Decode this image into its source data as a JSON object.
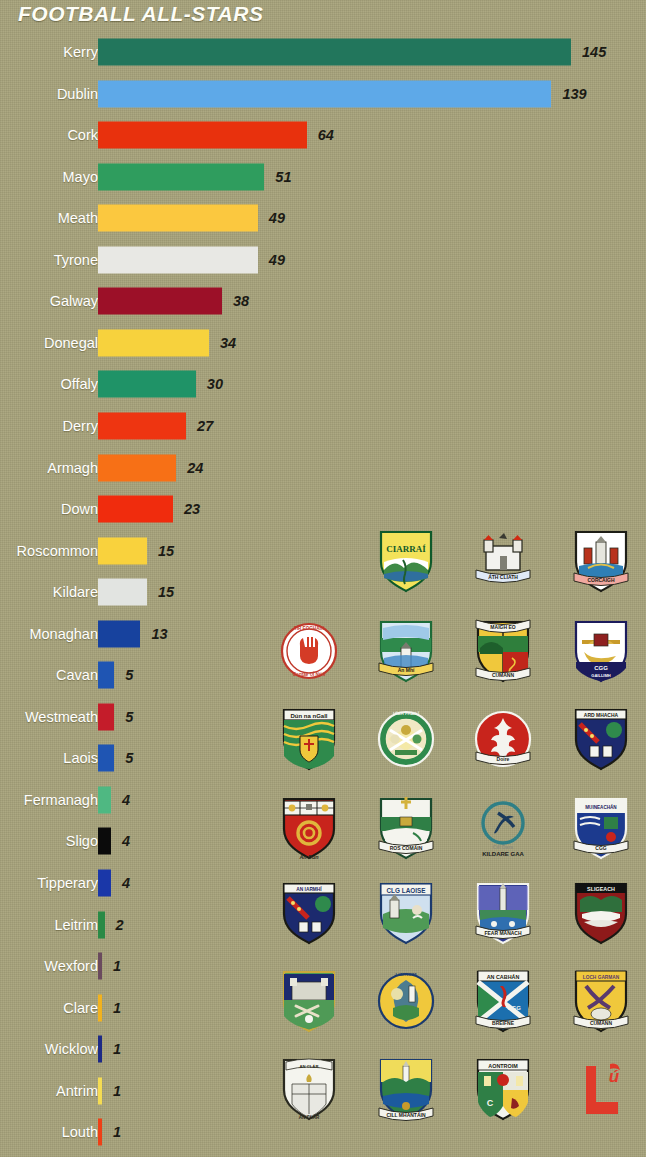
{
  "title": "FOOTBALL ALL-STARS",
  "background_color": "#a8a47c",
  "chart_data": {
    "type": "bar",
    "orientation": "horizontal",
    "title": "FOOTBALL ALL-STARS",
    "xlabel": "",
    "ylabel": "",
    "grid": false,
    "legend": "none",
    "xlim": [
      0,
      145
    ],
    "categories": [
      "Kerry",
      "Dublin",
      "Cork",
      "Mayo",
      "Meath",
      "Tyrone",
      "Galway",
      "Donegal",
      "Offaly",
      "Derry",
      "Armagh",
      "Down",
      "Roscommon",
      "Kildare",
      "Monaghan",
      "Cavan",
      "Westmeath",
      "Laois",
      "Fermanagh",
      "Sligo",
      "Tipperary",
      "Leitrim",
      "Wexford",
      "Clare",
      "Wicklow",
      "Antrim",
      "Louth"
    ],
    "values": [
      145,
      139,
      64,
      51,
      49,
      49,
      38,
      34,
      30,
      27,
      24,
      23,
      15,
      15,
      13,
      5,
      5,
      5,
      4,
      4,
      4,
      2,
      1,
      1,
      1,
      1,
      1
    ],
    "bar_colors": [
      "#22765c",
      "#5ea9e8",
      "#e8310d",
      "#2f9d5e",
      "#fbc83f",
      "#e8e8e4",
      "#9c1028",
      "#f7d23d",
      "#1f9367",
      "#ee3511",
      "#f77016",
      "#f02c0d",
      "#f9d23d",
      "#e2e4e1",
      "#17429e",
      "#1f55b3",
      "#c41c2a",
      "#1f55b3",
      "#4fb882",
      "#0b0b0b",
      "#1a37a8",
      "#2a8a46",
      "#6a4a5e",
      "#f2b21e",
      "#1d2a86",
      "#f5dc52",
      "#ee4016"
    ]
  },
  "crest_rows": [
    {
      "columns": 3,
      "items": [
        {
          "name": "Kerry",
          "gaelic": "CIARRAÍ",
          "icon": "kerry-crest-icon"
        },
        {
          "name": "Dublin",
          "gaelic": "ÁTH CLIATH",
          "icon": "dublin-crest-icon"
        },
        {
          "name": "Cork",
          "gaelic": "CORCAIGH",
          "icon": "cork-crest-icon"
        }
      ]
    },
    {
      "columns": 4,
      "items": [
        {
          "name": "Tyrone",
          "gaelic": "TÍR EOGHAIN",
          "icon": "tyrone-crest-icon"
        },
        {
          "name": "Meath",
          "gaelic": "An Mhí",
          "icon": "meath-crest-icon"
        },
        {
          "name": "Mayo",
          "gaelic": "MAIGH EO",
          "icon": "mayo-crest-icon"
        },
        {
          "name": "Galway",
          "gaelic": "GAILLIMH",
          "icon": "galway-crest-icon"
        }
      ]
    },
    {
      "columns": 4,
      "items": [
        {
          "name": "Donegal",
          "gaelic": "Dún na nGall",
          "icon": "donegal-crest-icon"
        },
        {
          "name": "Offaly",
          "gaelic": "UÍBH FHAILÍ",
          "icon": "offaly-crest-icon"
        },
        {
          "name": "Derry",
          "gaelic": "DOIRE",
          "icon": "derry-crest-icon"
        },
        {
          "name": "Armagh",
          "gaelic": "ARD MHACHA",
          "icon": "armagh-crest-icon"
        }
      ]
    },
    {
      "columns": 4,
      "items": [
        {
          "name": "Down",
          "gaelic": "An Dún",
          "icon": "down-crest-icon"
        },
        {
          "name": "Roscommon",
          "gaelic": "ROS COMÁIN",
          "icon": "roscommon-crest-icon"
        },
        {
          "name": "Kildare",
          "gaelic": "KILDARE GAA",
          "icon": "kildare-crest-icon"
        },
        {
          "name": "Monaghan",
          "gaelic": "MUINEACHÁN",
          "icon": "monaghan-crest-icon"
        }
      ]
    },
    {
      "columns": 4,
      "items": [
        {
          "name": "Westmeath",
          "gaelic": "AN IARMHÍ",
          "icon": "westmeath-crest-icon"
        },
        {
          "name": "Laois",
          "gaelic": "CLG LAOISE",
          "icon": "laois-crest-icon"
        },
        {
          "name": "Fermanagh",
          "gaelic": "FEAR MANACH",
          "icon": "fermanagh-crest-icon"
        },
        {
          "name": "Sligo",
          "gaelic": "SLIGEACH",
          "icon": "sligo-crest-icon"
        }
      ]
    },
    {
      "columns": 4,
      "items": [
        {
          "name": "Tipperary",
          "gaelic": "TIOBRAID ÁRANN",
          "icon": "tipperary-crest-icon"
        },
        {
          "name": "Leitrim",
          "gaelic": "LIATROIM",
          "icon": "leitrim-crest-icon"
        },
        {
          "name": "Cavan",
          "gaelic": "AN CABHÁN",
          "icon": "cavan-crest-icon"
        },
        {
          "name": "Wexford",
          "gaelic": "LOCH GARMAN",
          "icon": "wexford-crest-icon"
        }
      ]
    },
    {
      "columns": 4,
      "items": [
        {
          "name": "Clare",
          "gaelic": "AN CLÁR",
          "icon": "clare-crest-icon"
        },
        {
          "name": "Wicklow",
          "gaelic": "CILL MHANTÁIN",
          "icon": "wicklow-crest-icon"
        },
        {
          "name": "Antrim",
          "gaelic": "AONTROIM",
          "icon": "antrim-crest-icon"
        },
        {
          "name": "Louth",
          "gaelic": "Lú",
          "icon": "louth-crest-icon"
        }
      ]
    }
  ]
}
